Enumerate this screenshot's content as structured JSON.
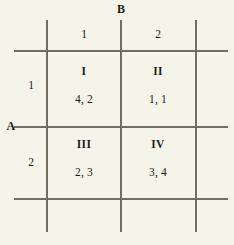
{
  "figure": {
    "type": "payoff-matrix",
    "background_color": "#f4f4e9",
    "rule_color": "#6f6f60",
    "text_color": "#1d1d14"
  },
  "players": {
    "row_player_label": "A",
    "column_player_label": "B"
  },
  "column_strategies": [
    {
      "label": "1"
    },
    {
      "label": "2"
    }
  ],
  "row_strategies": [
    {
      "label": "1"
    },
    {
      "label": "2"
    }
  ],
  "cells": [
    {
      "name": "I",
      "payoff": "4, 2",
      "row_strategy": "1",
      "column_strategy": "1",
      "row_payoff": 4,
      "column_payoff": 2
    },
    {
      "name": "II",
      "payoff": "1, 1",
      "row_strategy": "1",
      "column_strategy": "2",
      "row_payoff": 1,
      "column_payoff": 1
    },
    {
      "name": "III",
      "payoff": "2, 3",
      "row_strategy": "2",
      "column_strategy": "1",
      "row_payoff": 2,
      "column_payoff": 3
    },
    {
      "name": "IV",
      "payoff": "3, 4",
      "row_strategy": "2",
      "column_strategy": "2",
      "row_payoff": 3,
      "column_payoff": 4
    }
  ]
}
